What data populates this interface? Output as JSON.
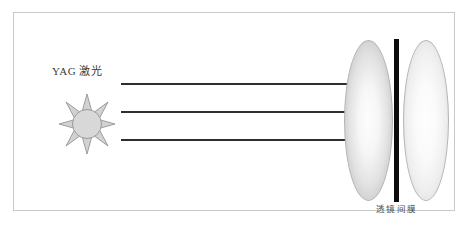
{
  "figure": {
    "background_color": "#ffffff",
    "frame": {
      "border_color": "#c9c9c9",
      "name": "figure-border"
    },
    "source": {
      "label": "YAG 激光",
      "icon": "sun-burst-icon",
      "icon_fill": "#d0d0d0",
      "icon_stroke": "#9a9a9a"
    },
    "beams": {
      "count": 3,
      "color": "#2e2e2e",
      "arrowhead_color": "#111111",
      "items": [
        {
          "label": "beam-1",
          "y": 82,
          "x_start": 120,
          "x_end": 378
        },
        {
          "label": "beam-2",
          "y": 110,
          "x_start": 120,
          "x_end": 378
        },
        {
          "label": "beam-3",
          "y": 138,
          "x_start": 120,
          "x_end": 378
        }
      ]
    },
    "optics": {
      "lens_left": {
        "name": "lens-left",
        "fill": "#e2e2e2",
        "stroke": "#b4b4b4"
      },
      "lens_right": {
        "name": "lens-right",
        "fill": "#efefef",
        "stroke": "#b4b4b4"
      },
      "membrane": {
        "name": "membrane-bar",
        "color": "#0c0c0c"
      },
      "membrane_label": "透镜间膜"
    }
  }
}
